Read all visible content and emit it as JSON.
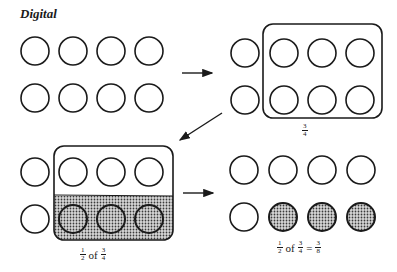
{
  "title": "Digital",
  "groups": {
    "start": {
      "circles": 8,
      "rows": 2,
      "cols": 4
    },
    "three_quarters": {
      "circles": 8,
      "selected": 6,
      "label": {
        "num": "3",
        "den": "4"
      }
    },
    "half_of_three_quarters": {
      "label": {
        "prefix_num": "1",
        "prefix_den": "2",
        "of": "of",
        "num": "3",
        "den": "4"
      }
    },
    "result": {
      "shaded": 3,
      "label": {
        "a_num": "1",
        "a_den": "2",
        "of": "of",
        "b_num": "3",
        "b_den": "4",
        "eq": "=",
        "c_num": "3",
        "c_den": "8"
      }
    }
  },
  "colors": {
    "stroke": "#1a1a1a",
    "shade": "#9a9a9a",
    "background": "#ffffff"
  }
}
